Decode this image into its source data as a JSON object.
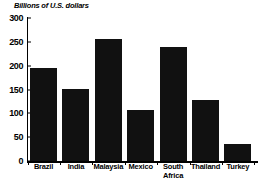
{
  "chart_data": {
    "type": "bar",
    "title": "Billions of U.S. dollars",
    "xlabel": "",
    "ylabel": "",
    "ylim": [
      0,
      300
    ],
    "yticks": [
      0,
      50,
      100,
      150,
      200,
      250,
      300
    ],
    "grid": false,
    "legend": null,
    "bar_color": "#111111",
    "categories": [
      "Brazil",
      "India",
      "Malaysia",
      "Mexico",
      "South\nAfrica",
      "Thailand",
      "Turkey"
    ],
    "values": [
      195,
      152,
      255,
      106,
      240,
      127,
      35
    ],
    "series": [
      {
        "name": "Billions of U.S. dollars",
        "values": [
          195,
          152,
          255,
          106,
          240,
          127,
          35
        ]
      }
    ]
  }
}
